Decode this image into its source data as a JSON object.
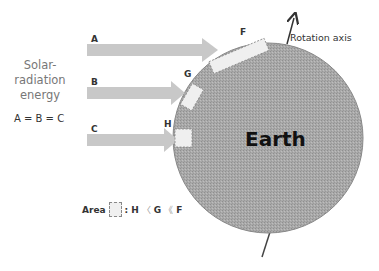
{
  "diagram": {
    "side_label": [
      "Solar-",
      "radiation",
      "energy"
    ],
    "equality": "A = B = C",
    "earth_label": "Earth",
    "axis_label": "Rotation axis",
    "rays": [
      {
        "label": "A"
      },
      {
        "label": "B"
      },
      {
        "label": "C"
      }
    ],
    "areas": [
      {
        "label": "F"
      },
      {
        "label": "G"
      },
      {
        "label": "H"
      }
    ],
    "legend": {
      "prefix": "Area",
      "colon": ":",
      "h": "H",
      "lt1": "〈",
      "g": "G",
      "lt2": "《",
      "f": "F"
    },
    "colors": {
      "ray": "#c8c8c8",
      "earth_fill": "#a8a8a8",
      "area_fill": "#efefef"
    }
  }
}
